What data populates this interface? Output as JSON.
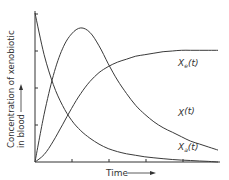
{
  "chart_data": {
    "type": "line",
    "title": "",
    "xlabel": "Time",
    "ylabel": [
      "Concentration of xenobiotic",
      "in blood"
    ],
    "grid": false,
    "legend_position": "inline labels at right end of curves",
    "x_ticks": 5,
    "y_ticks": 4,
    "xlim": [
      0,
      10
    ],
    "ylim": [
      0,
      1
    ],
    "x": [
      0,
      0.5,
      1,
      1.5,
      2,
      2.5,
      3,
      3.5,
      4,
      4.5,
      5,
      5.5,
      6,
      6.5,
      7,
      7.5,
      8,
      8.5,
      9,
      9.5,
      10
    ],
    "series": [
      {
        "name": "Xa(t)",
        "label_text": "X",
        "label_sub": "a",
        "label_suffix": "(t)",
        "values": [
          1.0,
          0.72,
          0.52,
          0.38,
          0.28,
          0.21,
          0.16,
          0.12,
          0.09,
          0.07,
          0.055,
          0.045,
          0.035,
          0.028,
          0.022,
          0.017,
          0.013,
          0.01,
          0.007,
          0.004,
          0.0
        ]
      },
      {
        "name": "X(t)",
        "label_text": "X",
        "label_sub": "",
        "label_suffix": "(t)",
        "values": [
          0.0,
          0.32,
          0.58,
          0.76,
          0.86,
          0.9,
          0.87,
          0.78,
          0.66,
          0.55,
          0.46,
          0.38,
          0.32,
          0.27,
          0.23,
          0.2,
          0.17,
          0.14,
          0.12,
          0.1,
          0.08
        ]
      },
      {
        "name": "Xe(t)",
        "label_text": "X",
        "label_sub": "e",
        "label_suffix": "(t)",
        "values": [
          0.0,
          0.05,
          0.14,
          0.25,
          0.36,
          0.46,
          0.54,
          0.6,
          0.64,
          0.67,
          0.69,
          0.71,
          0.72,
          0.73,
          0.74,
          0.745,
          0.75,
          0.75,
          0.75,
          0.75,
          0.75
        ]
      }
    ]
  },
  "labels": {
    "x_axis": "Time",
    "y_axis_line1": "Concentration of xenobiotic",
    "y_axis_line2": "in blood"
  }
}
